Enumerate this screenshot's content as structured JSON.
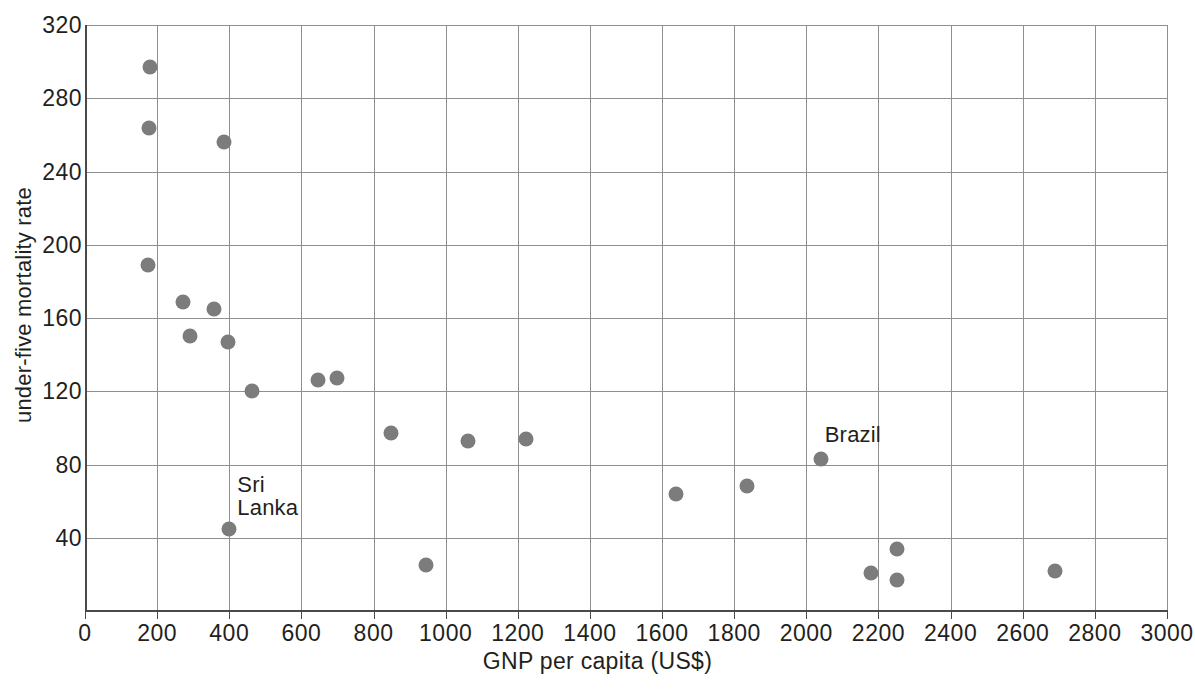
{
  "chart_data": {
    "type": "scatter",
    "title": "",
    "xlabel": "GNP per capita (US$)",
    "ylabel": "under-five mortality rate",
    "xlim": [
      0,
      3000
    ],
    "ylim": [
      0,
      320
    ],
    "xticks": [
      0,
      200,
      400,
      600,
      800,
      1000,
      1200,
      1400,
      1600,
      1800,
      2000,
      2200,
      2400,
      2600,
      2800,
      3000
    ],
    "yticks": [
      0,
      40,
      80,
      120,
      160,
      200,
      240,
      280,
      320
    ],
    "grid": true,
    "legend": false,
    "marker_color": "#7c7c7c",
    "points": [
      {
        "x": 180,
        "y": 297
      },
      {
        "x": 178,
        "y": 264
      },
      {
        "x": 385,
        "y": 256
      },
      {
        "x": 175,
        "y": 189
      },
      {
        "x": 272,
        "y": 169
      },
      {
        "x": 292,
        "y": 150
      },
      {
        "x": 358,
        "y": 165
      },
      {
        "x": 397,
        "y": 147
      },
      {
        "x": 462,
        "y": 120
      },
      {
        "x": 645,
        "y": 126
      },
      {
        "x": 700,
        "y": 127
      },
      {
        "x": 848,
        "y": 97
      },
      {
        "x": 1063,
        "y": 93
      },
      {
        "x": 1222,
        "y": 94
      },
      {
        "x": 400,
        "y": 45,
        "label": "Sri\nLanka"
      },
      {
        "x": 945,
        "y": 25
      },
      {
        "x": 1640,
        "y": 64
      },
      {
        "x": 1835,
        "y": 68
      },
      {
        "x": 2040,
        "y": 83,
        "label": "Brazil"
      },
      {
        "x": 2250,
        "y": 34
      },
      {
        "x": 2180,
        "y": 21
      },
      {
        "x": 2250,
        "y": 17
      },
      {
        "x": 2690,
        "y": 22
      }
    ],
    "annotations": [
      {
        "text": "Sri",
        "x": 400,
        "y": 45,
        "line2": "Lanka"
      },
      {
        "text": "Brazil",
        "x": 2040,
        "y": 83
      }
    ]
  }
}
